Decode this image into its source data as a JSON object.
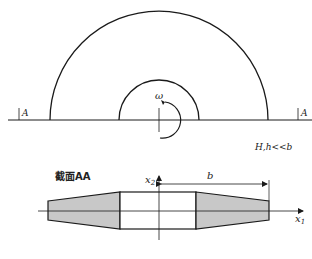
{
  "diagram": {
    "top_view": {
      "rotation_label": "ω",
      "section_marker_left": "A",
      "section_marker_right": "A"
    },
    "section_view": {
      "title": "截面AA",
      "condition": "H,h<<b",
      "axis_x1": "x",
      "axis_x1_sub": "1",
      "axis_x2": "x",
      "axis_x2_sub": "2",
      "dim_a": "a",
      "dim_b": "b",
      "dim_H": "H",
      "dim_h": "h",
      "region_label_sup": "0",
      "region_label": "V"
    },
    "colors": {
      "line": "#1a1a1a",
      "fill": "#c8c8c8"
    }
  }
}
